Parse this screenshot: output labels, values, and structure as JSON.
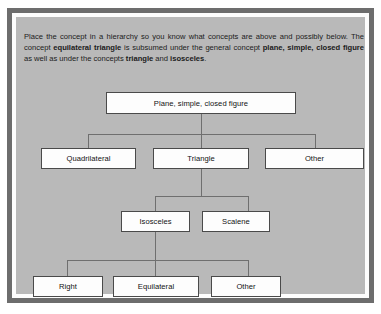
{
  "figure": {
    "intro_text": {
      "seg1": "Place the concept in a hierarchy so you know what concepts are above and possibly below.   The concept ",
      "bold1": "equilateral triangle",
      "seg2": " is subsumed under the general concept ",
      "bold2": "plane, simple, closed figure",
      "seg3": " as well as under the concepts ",
      "bold3": "triangle",
      "seg4": " and ",
      "bold4": "isosceles",
      "seg5": "."
    },
    "colors": {
      "frame": "#6d6d6d",
      "panel": "#b9b9b9",
      "node_fill": "#fdfdfd",
      "node_border": "#4a4a4a",
      "connector": "#6f6f6f",
      "text": "#121212"
    },
    "nodes": {
      "root": "Plane, simple, closed figure",
      "quadrilateral": "Quadrilateral",
      "triangle": "Triangle",
      "other_level2": "Other",
      "isosceles": "Isosceles",
      "scalene": "Scalene",
      "right": "Right",
      "equilateral": "Equilateral",
      "other_level4": "Other"
    }
  }
}
